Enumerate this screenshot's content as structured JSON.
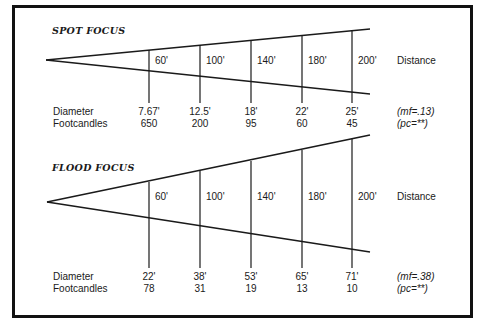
{
  "spot": {
    "title": "SPOT FOCUS",
    "distances": [
      "60'",
      "100'",
      "140'",
      "180'",
      "200'"
    ],
    "distance_label": "Distance",
    "diameter_label": "Diameter",
    "footcandles_label": "Footcandles",
    "diameters": [
      "7.67'",
      "12.5'",
      "18'",
      "22'",
      "25'"
    ],
    "footcandles": [
      "650",
      "200",
      "95",
      "60",
      "45"
    ],
    "mf_note": "(mf=.13)",
    "pc_note": "(pc=**)"
  },
  "flood": {
    "title": "FLOOD FOCUS",
    "distances": [
      "60'",
      "100'",
      "140'",
      "180'",
      "200'"
    ],
    "distance_label": "Distance",
    "diameter_label": "Diameter",
    "footcandles_label": "Footcandles",
    "diameters": [
      "22'",
      "38'",
      "53'",
      "65'",
      "71'"
    ],
    "footcandles": [
      "78",
      "31",
      "19",
      "13",
      "10"
    ],
    "mf_note": "(mf=.38)",
    "pc_note": "(pc=**)"
  },
  "colors": {
    "line": "#1a1a1a",
    "border": "#111111",
    "background": "#ffffff"
  }
}
